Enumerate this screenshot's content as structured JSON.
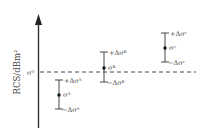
{
  "diagram": {
    "y_axis_label": "RCS/dBm²",
    "reference_label": "σ⁰",
    "reference_line_style": "dashed",
    "colors": {
      "line": "#333333",
      "text": "#444444",
      "background": "#ffffff"
    },
    "error_bars": [
      {
        "id": "A",
        "center_label": "σᴬ",
        "plus_label": "+Δσᴬ",
        "minus_label": "−Δσᴬ",
        "position": "below reference"
      },
      {
        "id": "B",
        "center_label": "σᴮ",
        "plus_label": "+Δσᴮ",
        "minus_label": "−Δσᴮ",
        "position": "straddles reference"
      },
      {
        "id": "C",
        "center_label": "σᶜ",
        "plus_label": "+Δσᶜ",
        "minus_label": "−Δσᶜ",
        "position": "above reference"
      }
    ]
  }
}
